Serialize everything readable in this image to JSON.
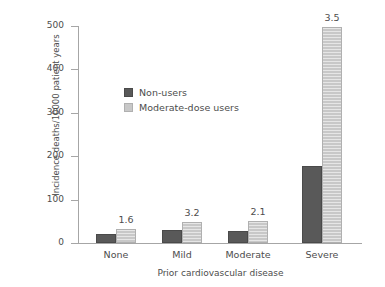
{
  "chart_data": {
    "type": "bar",
    "title": "",
    "xlabel": "Prior cardiovascular disease",
    "ylabel": "Incidence deaths/10000 patient years",
    "categories": [
      "None",
      "Mild",
      "Moderate",
      "Severe"
    ],
    "series": [
      {
        "name": "Non-users",
        "color": "#595959",
        "values": [
          20,
          30,
          28,
          177
        ]
      },
      {
        "name": "Moderate-dose users",
        "color": "#c8c8c8",
        "values": [
          32,
          48,
          50,
          497
        ]
      }
    ],
    "annotations": [
      "1.6",
      "3.2",
      "2.1",
      "3.5"
    ],
    "ylim": [
      0,
      500
    ],
    "yticks": [
      "0",
      "100",
      "200",
      "300",
      "400",
      "500"
    ],
    "grid": false,
    "legend_position": "inside-upper-left"
  },
  "legend": {
    "items": [
      {
        "label": "Non-users"
      },
      {
        "label": "Moderate-dose users"
      }
    ]
  },
  "axes": {
    "y_tick_labels": [
      "500",
      "400",
      "300",
      "200",
      "100",
      "0"
    ],
    "x_tick_labels": [
      "None",
      "Mild",
      "Moderate",
      "Severe"
    ],
    "y_title": "Incidence deaths/10000 patient years",
    "x_title": "Prior cardiovascular disease"
  }
}
